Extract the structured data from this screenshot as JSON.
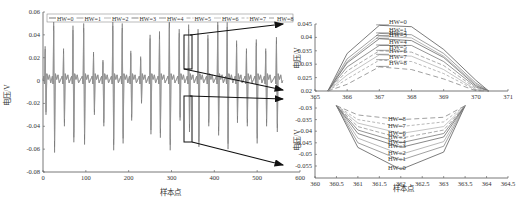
{
  "figure": {
    "arrow_color": "#111111",
    "line_color": "#555555"
  },
  "chart_data": [
    {
      "id": "main",
      "type": "line",
      "title": "",
      "xlabel": "样本点",
      "ylabel": "电压/V",
      "xlim": [
        0,
        600
      ],
      "ylim": [
        -0.08,
        0.06
      ],
      "xticks": [
        "0",
        "100",
        "200",
        "300",
        "400",
        "500",
        "600"
      ],
      "yticks": [
        "0.06",
        "0.04",
        "0.02",
        "0",
        "-0.02",
        "-0.04",
        "-0.06",
        "-0.08"
      ],
      "legend": [
        "HW=0",
        "HW=1",
        "HW=2",
        "HW=3",
        "HW=4",
        "HW=5",
        "HW=6",
        "HW=7",
        "HW=8"
      ],
      "legend_position": "top",
      "grid": false,
      "peaks": {
        "x": [
          5,
          25,
          48,
          70,
          95,
          118,
          140,
          163,
          185,
          205,
          228,
          250,
          272,
          295,
          318,
          340,
          362,
          385,
          408,
          430,
          452,
          475,
          498,
          520,
          545
        ],
        "max": [
          0.03,
          0.052,
          0.028,
          0.048,
          0.05,
          0.025,
          0.018,
          0.052,
          0.05,
          0.026,
          0.021,
          0.04,
          0.043,
          0.055,
          0.045,
          0.049,
          0.045,
          0.04,
          0.053,
          0.051,
          0.035,
          0.028,
          0.036,
          0.028,
          0.038
        ],
        "min": [
          -0.03,
          -0.063,
          -0.04,
          -0.054,
          -0.056,
          -0.03,
          -0.04,
          -0.061,
          -0.055,
          -0.035,
          -0.02,
          -0.047,
          -0.05,
          -0.061,
          -0.035,
          -0.045,
          -0.058,
          -0.04,
          -0.048,
          -0.06,
          -0.037,
          -0.04,
          -0.055,
          -0.04,
          -0.045
        ]
      },
      "zoom_boxes": [
        {
          "x_range": [
            360,
            371
          ],
          "y_range": [
            0.02,
            0.045
          ],
          "target": "top_zoom"
        },
        {
          "x_range": [
            360,
            364.5
          ],
          "y_range": [
            -0.055,
            -0.03
          ],
          "target": "bottom_zoom"
        }
      ]
    },
    {
      "id": "top_zoom",
      "type": "line",
      "xlabel": "",
      "ylabel": "电压/V",
      "xlim": [
        365,
        371
      ],
      "ylim": [
        0.02,
        0.045
      ],
      "xticks": [
        "365",
        "366",
        "367",
        "368",
        "369",
        "370",
        "371"
      ],
      "yticks": [
        "0.045",
        "0.04",
        "0.035",
        "0.03",
        "0.025",
        "0.02"
      ],
      "x": [
        365.4,
        366,
        367,
        368,
        369,
        370,
        370.4
      ],
      "series": [
        {
          "name": "HW=0",
          "values": [
            0.02,
            0.034,
            0.0445,
            0.044,
            0.0355,
            0.024,
            0.02
          ]
        },
        {
          "name": "HW=1",
          "values": [
            0.02,
            0.032,
            0.0415,
            0.041,
            0.034,
            0.023,
            0.02
          ]
        },
        {
          "name": "HW=2",
          "values": [
            0.02,
            0.031,
            0.0405,
            0.0398,
            0.033,
            0.0225,
            0.02
          ]
        },
        {
          "name": "HW=3",
          "values": [
            0.02,
            0.0305,
            0.0395,
            0.0388,
            0.0325,
            0.022,
            0.02
          ]
        },
        {
          "name": "HW=4",
          "values": [
            0.02,
            0.029,
            0.037,
            0.037,
            0.031,
            0.0215,
            0.02
          ]
        },
        {
          "name": "HW=5",
          "values": [
            0.02,
            0.0275,
            0.035,
            0.0345,
            0.0295,
            0.021,
            0.02
          ]
        },
        {
          "name": "HW=6",
          "values": [
            0.02,
            0.026,
            0.0335,
            0.033,
            0.028,
            0.0205,
            0.02
          ]
        },
        {
          "name": "HW=7",
          "values": [
            0.02,
            0.0245,
            0.0315,
            0.031,
            0.0265,
            0.0203,
            0.02
          ]
        },
        {
          "name": "HW=8",
          "values": [
            0.02,
            0.0225,
            0.029,
            0.028,
            0.0245,
            0.0201,
            0.02
          ]
        }
      ]
    },
    {
      "id": "bottom_zoom",
      "type": "line",
      "xlabel": "样本点",
      "ylabel": "电压/V",
      "xlim": [
        360,
        364.5
      ],
      "ylim": [
        -0.057,
        -0.028
      ],
      "xticks": [
        "360",
        "360.5",
        "361",
        "361.5",
        "362",
        "362.5",
        "363",
        "363.5",
        "364",
        "364.5"
      ],
      "yticks": [
        "-0.03",
        "-0.035",
        "-0.04",
        "-0.045",
        "-0.05",
        "-0.055"
      ],
      "x": [
        360.5,
        361,
        362,
        363,
        363.5
      ],
      "series": [
        {
          "name": "HW=0",
          "values": [
            -0.029,
            -0.047,
            -0.0565,
            -0.049,
            -0.029
          ]
        },
        {
          "name": "HW=1",
          "values": [
            -0.029,
            -0.045,
            -0.0525,
            -0.0465,
            -0.029
          ]
        },
        {
          "name": "HW=2",
          "values": [
            -0.029,
            -0.043,
            -0.05,
            -0.0445,
            -0.029
          ]
        },
        {
          "name": "HW=3",
          "values": [
            -0.029,
            -0.041,
            -0.047,
            -0.0425,
            -0.029
          ]
        },
        {
          "name": "HW=4",
          "values": [
            -0.029,
            -0.0395,
            -0.045,
            -0.041,
            -0.029
          ]
        },
        {
          "name": "HW=5",
          "values": [
            -0.029,
            -0.038,
            -0.043,
            -0.0395,
            -0.029
          ]
        },
        {
          "name": "HW=6",
          "values": [
            -0.029,
            -0.0365,
            -0.041,
            -0.038,
            -0.029
          ]
        },
        {
          "name": "HW=7",
          "values": [
            -0.029,
            -0.035,
            -0.038,
            -0.036,
            -0.029
          ]
        },
        {
          "name": "HW=8",
          "values": [
            -0.029,
            -0.033,
            -0.035,
            -0.034,
            -0.029
          ]
        }
      ]
    }
  ]
}
